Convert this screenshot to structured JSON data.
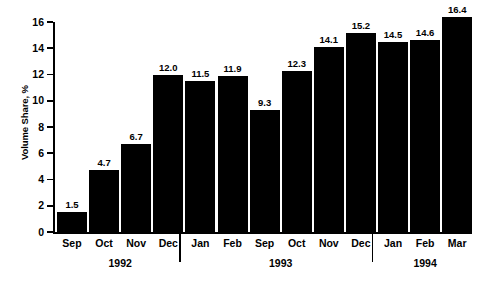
{
  "chart_data": {
    "type": "bar",
    "title": "",
    "subtitle": "",
    "xlabel": "",
    "ylabel": "Volume Share, %",
    "ylim": [
      0,
      16
    ],
    "ytick_step": 2,
    "yticks": [
      "16",
      "14",
      "12",
      "10",
      "8",
      "6",
      "4",
      "2",
      "0"
    ],
    "grid": false,
    "legend": null,
    "bar_color": "#000000",
    "background_color": "#ffffff",
    "axis_color": "#000000",
    "categories": [
      "Sep",
      "Oct",
      "Nov",
      "Dec",
      "Jan",
      "Feb",
      "Sep",
      "Oct",
      "Nov",
      "Dec",
      "Jan",
      "Feb",
      "Mar"
    ],
    "values": [
      1.5,
      4.7,
      6.7,
      12.0,
      11.5,
      11.9,
      9.3,
      12.3,
      14.1,
      15.2,
      14.5,
      14.6,
      16.4
    ],
    "value_labels": [
      "1.5",
      "4.7",
      "6.7",
      "12.0",
      "11.5",
      "11.9",
      "9.3",
      "12.3",
      "14.1",
      "15.2",
      "14.5",
      "14.6",
      "16.4"
    ],
    "groups": [
      {
        "label": "1992",
        "categories": [
          "Sep",
          "Oct",
          "Nov",
          "Dec"
        ]
      },
      {
        "label": "1993",
        "categories": [
          "Jan",
          "Feb",
          "Sep",
          "Oct",
          "Nov",
          "Dec"
        ]
      },
      {
        "label": "1994",
        "categories": [
          "Jan",
          "Feb",
          "Mar"
        ]
      }
    ]
  },
  "bars": [
    {
      "month": "Sep",
      "value": "1.5"
    },
    {
      "month": "Oct",
      "value": "4.7"
    },
    {
      "month": "Nov",
      "value": "6.7"
    },
    {
      "month": "Dec",
      "value": "12.0"
    },
    {
      "month": "Jan",
      "value": "11.5"
    },
    {
      "month": "Feb",
      "value": "11.9"
    },
    {
      "month": "Sep",
      "value": "9.3"
    },
    {
      "month": "Oct",
      "value": "12.3"
    },
    {
      "month": "Nov",
      "value": "14.1"
    },
    {
      "month": "Dec",
      "value": "15.2"
    },
    {
      "month": "Jan",
      "value": "14.5"
    },
    {
      "month": "Feb",
      "value": "14.6"
    },
    {
      "month": "Mar",
      "value": "16.4"
    }
  ],
  "years": [
    {
      "label": "1992"
    },
    {
      "label": "1993"
    },
    {
      "label": "1994"
    }
  ],
  "axis": {
    "y_title": "Volume Share, %",
    "y_ticks": [
      "16",
      "14",
      "12",
      "10",
      "8",
      "6",
      "4",
      "2",
      "0"
    ]
  }
}
